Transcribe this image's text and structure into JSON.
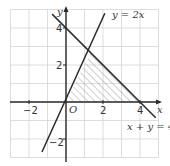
{
  "figure": {
    "type": "coordinate-plane-inequality-region",
    "colors": {
      "grid": "#d4d4d4",
      "axis": "#2a2a2a",
      "line": "#2a2a2a",
      "hatch": "#8a8a8a",
      "background": "#ffffff"
    },
    "axes": {
      "x_label": "x",
      "y_label": "y",
      "origin_label": "O",
      "x_range": [
        -3,
        5
      ],
      "y_range": [
        -3,
        5
      ],
      "x_tick_labels": [
        {
          "value": -2,
          "text": "−2"
        },
        {
          "value": 2,
          "text": "2"
        },
        {
          "value": 4,
          "text": "4"
        }
      ],
      "y_tick_labels": [
        {
          "value": 4,
          "text": "4"
        },
        {
          "value": 2,
          "text": "2"
        },
        {
          "value": -2,
          "text": "−2"
        }
      ]
    },
    "lines": [
      {
        "name": "y=2x",
        "label": "y = 2x",
        "from": [
          -1.3,
          -2.7
        ],
        "to": [
          2.1,
          4.8
        ]
      },
      {
        "name": "x+y=4",
        "label": "x + y = 4",
        "from": [
          -0.75,
          4.75
        ],
        "to": [
          4.85,
          -0.85
        ]
      }
    ],
    "shaded_region": {
      "description": "hatched triangle bounded by y = 2x, x + y = 4 and the x-axis",
      "vertices": [
        [
          0,
          0
        ],
        [
          1.333,
          2.667
        ],
        [
          4,
          0
        ]
      ],
      "fill": "diagonal-hatch"
    }
  }
}
